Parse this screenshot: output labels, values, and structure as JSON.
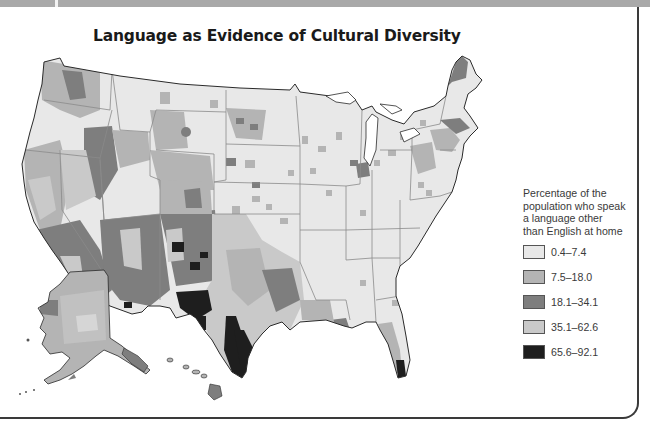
{
  "title": "Language as Evidence of Cultural Diversity",
  "legend": {
    "title_lines": [
      "Percentage of the",
      "population who speak",
      "a language other",
      "than English at home"
    ],
    "items": [
      {
        "label": "0.4–7.4",
        "color": "#e8e8e8"
      },
      {
        "label": "7.5–18.0",
        "color": "#b4b4b4"
      },
      {
        "label": "18.1–34.1",
        "color": "#7e7e7e"
      },
      {
        "label": "35.1–62.6",
        "color": "#c9c9c9"
      },
      {
        "label": "65.6–92.1",
        "color": "#1e1e1e"
      }
    ]
  },
  "colors": {
    "band": "#a9a9a9",
    "border": "#3a3a3a",
    "land_base": "#e8e8e8",
    "state_line": "#8a8a8a",
    "coast_line": "#2a2a2a"
  },
  "map": {
    "subject": "United States counties shaded by percentage of population speaking a language other than English at home",
    "regions_shown": [
      "Contiguous United States",
      "Alaska",
      "Hawaii"
    ]
  }
}
